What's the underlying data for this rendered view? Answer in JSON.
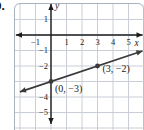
{
  "problem_number": "9.",
  "chart_data": {
    "type": "line",
    "title": "",
    "xlabel": "x",
    "ylabel": "y",
    "x_range": [
      -2,
      6
    ],
    "y_range": [
      -6,
      2
    ],
    "grid": true,
    "x_tick_labels": [
      {
        "value": -1,
        "label": "−1"
      },
      {
        "value": 1,
        "label": "1"
      },
      {
        "value": 2,
        "label": "2"
      },
      {
        "value": 3,
        "label": "3"
      },
      {
        "value": 4,
        "label": "4"
      },
      {
        "value": 5,
        "label": "5"
      }
    ],
    "y_tick_labels": [
      {
        "value": 1,
        "label": "1"
      },
      {
        "value": -1,
        "label": "−1"
      },
      {
        "value": -2,
        "label": "−2"
      },
      {
        "value": -4,
        "label": "−4"
      },
      {
        "value": -5,
        "label": "−5"
      }
    ],
    "series": [
      {
        "name": "line-through-points",
        "slope": 0.3333,
        "y_intercept": -3,
        "points": [
          [
            0,
            -3
          ],
          [
            3,
            -2
          ]
        ],
        "draw_extent_x": [
          -2,
          5.9
        ]
      }
    ],
    "point_annotations": [
      {
        "point": [
          0,
          -3
        ],
        "text": "(0, −3)"
      },
      {
        "point": [
          3,
          -2
        ],
        "text": "(3, −2)"
      }
    ],
    "colors": {
      "grid": "#c9ced6",
      "axis": "#1c1c1c",
      "line": "#3a3a3a",
      "text": "#1c1c1c",
      "panel_border": "#aab2ba",
      "background": "#ffffff"
    }
  }
}
